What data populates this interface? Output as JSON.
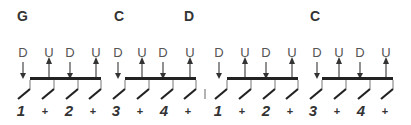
{
  "chords": [
    {
      "name": "G",
      "x": 17
    },
    {
      "name": "C",
      "x": 114
    },
    {
      "name": "D",
      "x": 184
    },
    {
      "name": "C",
      "x": 310
    }
  ],
  "groups": [
    {
      "bar_start": 30,
      "bar_end": 101,
      "beats": [
        30,
        54,
        78,
        101
      ]
    },
    {
      "bar_start": 125,
      "bar_end": 196,
      "beats": [
        125,
        149,
        173,
        196
      ]
    },
    {
      "bar_start": 227,
      "bar_end": 298,
      "beats": [
        227,
        251,
        275,
        298
      ]
    },
    {
      "bar_start": 322,
      "bar_end": 393,
      "beats": [
        322,
        346,
        370,
        393
      ]
    }
  ],
  "strums": [
    {
      "dir": "D",
      "x": 23
    },
    {
      "dir": "U",
      "x": 49
    },
    {
      "dir": "D",
      "x": 70
    },
    {
      "dir": "U",
      "x": 96
    },
    {
      "dir": "D",
      "x": 118
    },
    {
      "dir": "U",
      "x": 142
    },
    {
      "dir": "D",
      "x": 163
    },
    {
      "dir": "U",
      "x": 190
    },
    {
      "dir": "D",
      "x": 219
    },
    {
      "dir": "U",
      "x": 245
    },
    {
      "dir": "D",
      "x": 266
    },
    {
      "dir": "U",
      "x": 292
    },
    {
      "dir": "D",
      "x": 317
    },
    {
      "dir": "U",
      "x": 339
    },
    {
      "dir": "D",
      "x": 360
    },
    {
      "dir": "U",
      "x": 386
    }
  ],
  "counts": [
    {
      "label": "1",
      "x": 21,
      "type": "num"
    },
    {
      "label": "+",
      "x": 45,
      "type": "plus"
    },
    {
      "label": "2",
      "x": 69,
      "type": "num"
    },
    {
      "label": "+",
      "x": 93,
      "type": "plus"
    },
    {
      "label": "3",
      "x": 116,
      "type": "num"
    },
    {
      "label": "+",
      "x": 140,
      "type": "plus"
    },
    {
      "label": "4",
      "x": 164,
      "type": "num"
    },
    {
      "label": "+",
      "x": 188,
      "type": "plus"
    },
    {
      "label": "1",
      "x": 218,
      "type": "num"
    },
    {
      "label": "+",
      "x": 242,
      "type": "plus"
    },
    {
      "label": "2",
      "x": 266,
      "type": "num"
    },
    {
      "label": "+",
      "x": 290,
      "type": "plus"
    },
    {
      "label": "3",
      "x": 313,
      "type": "num"
    },
    {
      "label": "+",
      "x": 337,
      "type": "plus"
    },
    {
      "label": "4",
      "x": 361,
      "type": "num"
    },
    {
      "label": "+",
      "x": 385,
      "type": "plus"
    }
  ],
  "bar_line": {
    "x": 205
  },
  "colors": {
    "ink": "#333333",
    "arrow": "#555555",
    "bar": "#222222"
  }
}
